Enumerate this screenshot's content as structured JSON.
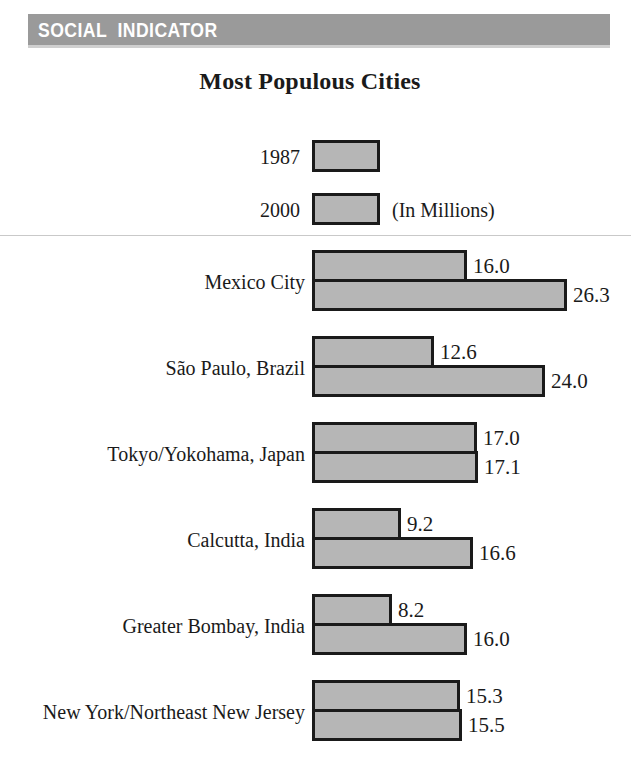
{
  "banner": {
    "text": "SOCIAL  INDICATOR",
    "background_color": "#9a9a9a",
    "text_color": "#ffffff"
  },
  "chart_data": {
    "type": "bar",
    "orientation": "horizontal",
    "title": "Most Populous Cities",
    "units_note": "(In Millions)",
    "xlabel": "",
    "ylabel": "",
    "grid": false,
    "legend_position": "top-center",
    "bar_fill_color": "#b6b6b6",
    "bar_border_color": "#1a1a1a",
    "categories": [
      "Mexico City",
      "São Paulo, Brazil",
      "Tokyo/Yokohama, Japan",
      "Calcutta, India",
      "Greater Bombay, India",
      "New York/Northeast New Jersey"
    ],
    "series": [
      {
        "name": "1987",
        "values": [
          16.0,
          12.6,
          17.0,
          9.2,
          8.2,
          15.3
        ],
        "labels": [
          "16.0",
          "12.6",
          "17.0",
          "9.2",
          "8.2",
          "15.3"
        ]
      },
      {
        "name": "2000",
        "values": [
          26.3,
          24.0,
          17.1,
          16.6,
          16.0,
          15.5
        ],
        "labels": [
          "26.3",
          "24.0",
          "17.1",
          "16.6",
          "16.0",
          "15.5"
        ]
      }
    ],
    "xlim": [
      0,
      26.3
    ]
  }
}
